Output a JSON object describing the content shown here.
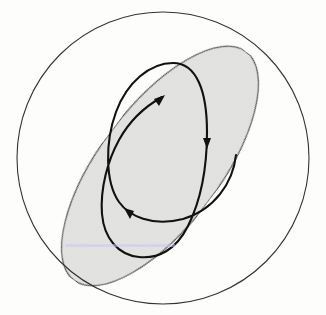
{
  "figure": {
    "colors": {
      "background": "#fdfdfb",
      "circle_stroke": "#333333",
      "ellipse_fill": "#e4e4e2",
      "ellipse_stroke": "#3a3a3a",
      "trajectory_stroke": "#111111"
    },
    "elements": {
      "outer_circle": {
        "cx": 163,
        "cy": 160,
        "r": 147
      },
      "shaded_ellipse": {
        "cx": 161,
        "cy": 166,
        "rx": 62,
        "ry": 143,
        "rotation_deg": 36
      },
      "trajectory": {
        "path": "M236,155 C232,185 212,212 180,220 C150,226 128,214 118,200 C104,180 104,140 116,110 C128,80 150,63 172,63 C196,63 207,90 207,130 C207,170 200,200 188,224 C176,250 158,258 140,256 C118,254 104,238 102,215 C100,190 108,160 118,140 C130,118 146,106 163,97",
        "arrows": [
          {
            "x": 163,
            "y": 97,
            "direction": "up-right"
          },
          {
            "x": 207,
            "y": 143,
            "direction": "down"
          },
          {
            "x": 128,
            "y": 213,
            "direction": "up-left"
          }
        ]
      }
    },
    "caption": ""
  }
}
